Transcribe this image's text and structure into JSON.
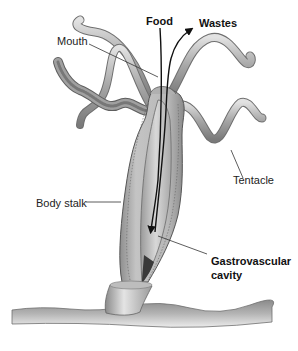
{
  "diagram": {
    "labels": {
      "food": "Food",
      "wastes": "Wastes",
      "mouth": "Mouth",
      "tentacle": "Tentacle",
      "body_stalk": "Body stalk",
      "cavity_line1": "Gastrovascular",
      "cavity_line2": "cavity"
    },
    "colors": {
      "tentacle_fill": "#9a9a9a",
      "tentacle_highlight": "#d6d6d6",
      "body_wall": "#a8a8a8",
      "cavity": "#c9c9c9",
      "cavity_dark": "#3a3a3a",
      "ground": "#9c9c9c",
      "leader_line": "#333333",
      "arrow": "#111111"
    }
  }
}
